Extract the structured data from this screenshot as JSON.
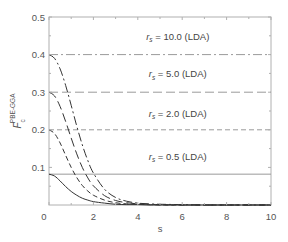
{
  "chart_data": {
    "type": "line",
    "title": "",
    "xlabel": "s",
    "ylabel": "F_c^PBE-GGA",
    "ylabel_parts": {
      "main": "F",
      "sub": "c",
      "sup": "PBE-GGA"
    },
    "xlim": [
      0,
      10
    ],
    "ylim": [
      0,
      0.5
    ],
    "xticks": [
      0,
      2,
      4,
      6,
      8,
      10
    ],
    "xtick_labels": [
      "0",
      "2",
      "4",
      "6",
      "8",
      "10"
    ],
    "yticks": [
      0.1,
      0.2,
      0.3,
      0.4,
      0.5
    ],
    "ytick_labels": [
      "0.1",
      "0.2",
      "0.3",
      "0.4",
      "0.5"
    ],
    "grid": false,
    "legend": "inline annotations",
    "x": [
      0,
      0.25,
      0.5,
      0.75,
      1.0,
      1.25,
      1.5,
      1.75,
      2.0,
      2.5,
      3.0,
      3.5,
      4.0,
      4.5,
      5.0,
      6.0,
      7.0,
      8.0,
      9.0,
      10.0
    ],
    "series": [
      {
        "name": "r_s = 10.0 (GGA)",
        "style": "dashdot",
        "lda_value": 0.4,
        "values": [
          0.4,
          0.39,
          0.362,
          0.318,
          0.265,
          0.21,
          0.16,
          0.118,
          0.085,
          0.042,
          0.02,
          0.01,
          0.005,
          0.003,
          0.002,
          0.001,
          0.0,
          0.0,
          0.0,
          0.0
        ]
      },
      {
        "name": "r_s = 5.0 (GGA)",
        "style": "longdash",
        "lda_value": 0.3,
        "values": [
          0.3,
          0.29,
          0.262,
          0.222,
          0.178,
          0.136,
          0.1,
          0.072,
          0.051,
          0.025,
          0.012,
          0.006,
          0.003,
          0.002,
          0.001,
          0.0,
          0.0,
          0.0,
          0.0,
          0.0
        ]
      },
      {
        "name": "r_s = 2.0 (GGA)",
        "style": "dash",
        "lda_value": 0.2,
        "values": [
          0.2,
          0.19,
          0.165,
          0.132,
          0.1,
          0.073,
          0.052,
          0.037,
          0.026,
          0.013,
          0.006,
          0.003,
          0.002,
          0.001,
          0.0,
          0.0,
          0.0,
          0.0,
          0.0,
          0.0
        ]
      },
      {
        "name": "r_s = 0.5 (GGA)",
        "style": "solid",
        "lda_value": 0.082,
        "values": [
          0.082,
          0.077,
          0.064,
          0.049,
          0.036,
          0.026,
          0.018,
          0.013,
          0.009,
          0.005,
          0.002,
          0.001,
          0.001,
          0.0,
          0.0,
          0.0,
          0.0,
          0.0,
          0.0,
          0.0
        ]
      }
    ],
    "reference_lines": [
      {
        "label_prefix": "r",
        "label_sub": "s",
        "label_rest": " = 10.0 (LDA)",
        "y": 0.4,
        "style": "dashdot"
      },
      {
        "label_prefix": "r",
        "label_sub": "s",
        "label_rest": " = 5.0 (LDA)",
        "y": 0.3,
        "style": "longdash"
      },
      {
        "label_prefix": "r",
        "label_sub": "s",
        "label_rest": " = 2.0 (LDA)",
        "y": 0.2,
        "style": "dash"
      },
      {
        "label_prefix": "r",
        "label_sub": "s",
        "label_rest": " = 0.5 (LDA)",
        "y": 0.082,
        "style": "solid"
      }
    ],
    "annotations": [
      {
        "text": "r_s = 10.0 (LDA)",
        "x": 5.8,
        "y": 0.44
      },
      {
        "text": "r_s = 5.0 (LDA)",
        "x": 5.8,
        "y": 0.34
      },
      {
        "text": "r_s = 2.0 (LDA)",
        "x": 5.8,
        "y": 0.235
      },
      {
        "text": "r_s = 0.5 (LDA)",
        "x": 5.8,
        "y": 0.12
      }
    ],
    "colors": {
      "line": "#333333",
      "reference": "#9a9a9a",
      "axis": "#b0b0b0",
      "text": "#555555"
    }
  }
}
